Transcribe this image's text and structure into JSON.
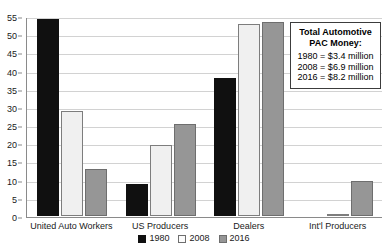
{
  "chart_data": {
    "type": "bar",
    "title": "",
    "xlabel": "",
    "ylabel": "",
    "ylim": [
      0,
      55
    ],
    "ytick_step": 5,
    "yticks": [
      0,
      5,
      10,
      15,
      20,
      25,
      30,
      35,
      40,
      45,
      50,
      55
    ],
    "grid": true,
    "legend_position": "bottom",
    "categories": [
      "United Auto Workers",
      "US Producers",
      "Dealers",
      "Int'l Producers"
    ],
    "series": [
      {
        "name": "1980",
        "color": "#101010",
        "values": [
          54.2,
          8.7,
          38.0,
          0.0
        ]
      },
      {
        "name": "2008",
        "color": "#f0f0f0",
        "values": [
          29.0,
          19.4,
          52.8,
          0.4
        ]
      },
      {
        "name": "2016",
        "color": "#969696",
        "values": [
          13.0,
          25.2,
          53.3,
          9.5
        ]
      }
    ],
    "annotations": [
      {
        "title_line_1": "Total Automotive",
        "title_line_2": "PAC Money:",
        "lines": [
          "1980 = $3.4 million",
          "2008 = $6.9 million",
          "2016 = $8.2 million"
        ]
      }
    ]
  },
  "colors": {
    "series_1980": "#101010",
    "series_2008": "#f0f0f0",
    "series_2016": "#969696",
    "gridline": "#d2d2d2",
    "axis": "#8a8a8a",
    "annotation_border": "#3c3c3c"
  }
}
